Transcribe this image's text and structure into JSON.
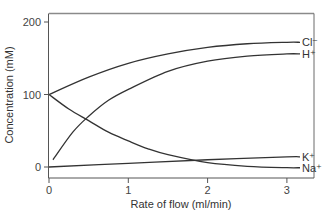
{
  "chart_data": {
    "type": "line",
    "title": "",
    "xlabel": "Rate of flow (ml/min)",
    "ylabel": "Concentration (mM)",
    "xlim": [
      0,
      3.3
    ],
    "ylim": [
      -15,
      215
    ],
    "xticks": [
      0,
      1,
      2,
      3
    ],
    "yticks": [
      0,
      100,
      200
    ],
    "grid": false,
    "legend": "inline labels at right end of each line",
    "series": [
      {
        "name": "Cl-",
        "label": "Cl⁻",
        "x": [
          0,
          0.5,
          1,
          1.5,
          2,
          2.5,
          3
        ],
        "values": [
          100,
          124,
          143,
          156,
          165,
          170,
          172
        ]
      },
      {
        "name": "H+",
        "label": "H⁺",
        "x": [
          0.05,
          0.3,
          0.5,
          0.75,
          1,
          1.5,
          2,
          2.5,
          3
        ],
        "values": [
          10,
          48,
          70,
          92,
          107,
          132,
          146,
          153,
          156
        ]
      },
      {
        "name": "K+",
        "label": "K⁺",
        "x": [
          0,
          1,
          2,
          3
        ],
        "values": [
          0,
          5,
          10,
          14
        ]
      },
      {
        "name": "Na+",
        "label": "Na⁺",
        "x": [
          0,
          0.25,
          0.5,
          0.75,
          1,
          1.25,
          1.5,
          2,
          2.5,
          3
        ],
        "values": [
          100,
          80,
          64,
          48,
          36,
          25,
          17,
          6,
          1,
          -1
        ]
      }
    ]
  }
}
